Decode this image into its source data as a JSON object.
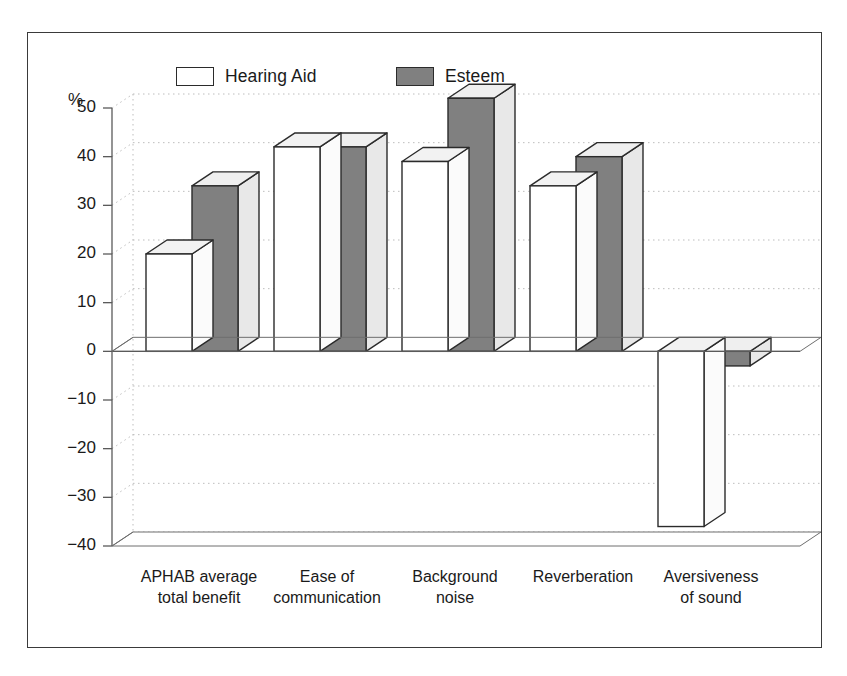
{
  "chart_data": {
    "type": "bar",
    "title": "",
    "subtitle": "",
    "xlabel": "",
    "ylabel": "%",
    "ylim": [
      -40,
      50
    ],
    "ytick_step": 10,
    "yticks": [
      50,
      40,
      30,
      20,
      10,
      0,
      -10,
      -20,
      -30,
      -40
    ],
    "ytick_labels": [
      "50",
      "40",
      "30",
      "20",
      "10",
      "0",
      "−10",
      "−20",
      "−30",
      "−40"
    ],
    "grid": true,
    "grid_style": "dotted-horizontal",
    "projection": "3d-bar",
    "legend_position": "top-center",
    "categories": [
      "APHAB average\ntotal benefit",
      "Ease of\ncommunication",
      "Background\nnoise",
      "Reverberation",
      "Aversiveness\nof sound"
    ],
    "series": [
      {
        "name": "Hearing Aid",
        "color": "#ffffff",
        "edge_color": "#2b2b2b",
        "values": [
          20,
          42,
          39,
          34,
          -36
        ]
      },
      {
        "name": "Esteem",
        "color": "#808080",
        "edge_color": "#2b2b2b",
        "values": [
          34,
          42,
          52,
          40,
          -3
        ]
      }
    ]
  },
  "legend": {
    "items": [
      {
        "label": "Hearing Aid",
        "swatch": "outline"
      },
      {
        "label": "Esteem",
        "swatch": "filled"
      }
    ]
  },
  "axis": {
    "unit": "%"
  },
  "colors": {
    "bar_fill_light": "#ffffff",
    "bar_fill_dark": "#808080",
    "bar_top_light": "#f2f2f2",
    "bar_side_light": "#fbfbfb",
    "bar_top_dark": "#efefef",
    "bar_side_dark": "#e8e8e8",
    "outline": "#2b2b2b",
    "frame": "#3a3a3a",
    "grid": "#bdbdbd",
    "floor": "#ffffff",
    "text": "#1a1a1a"
  }
}
